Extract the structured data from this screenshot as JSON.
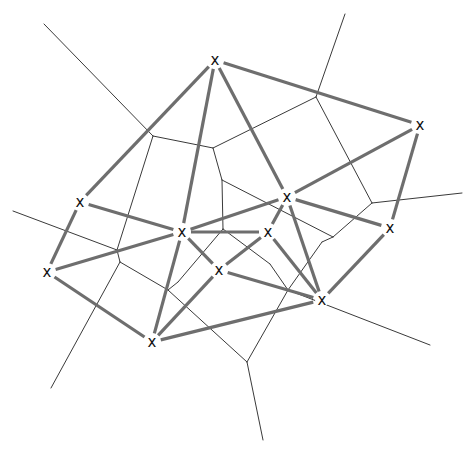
{
  "diagram": {
    "site_marker": "x",
    "colors": {
      "background": "#ffffff",
      "voronoi_edge": "#3a3a3a",
      "delaunay_edge": "#6e6e6e",
      "site_marker": "#111111"
    },
    "sites": [
      {
        "id": "A",
        "x": 215,
        "y": 60
      },
      {
        "id": "B",
        "x": 420,
        "y": 125
      },
      {
        "id": "C",
        "x": 80,
        "y": 202
      },
      {
        "id": "D",
        "x": 287,
        "y": 197
      },
      {
        "id": "E",
        "x": 182,
        "y": 232
      },
      {
        "id": "F",
        "x": 268,
        "y": 232
      },
      {
        "id": "G",
        "x": 390,
        "y": 228
      },
      {
        "id": "H",
        "x": 47,
        "y": 272
      },
      {
        "id": "I",
        "x": 219,
        "y": 270
      },
      {
        "id": "J",
        "x": 322,
        "y": 300
      },
      {
        "id": "K",
        "x": 152,
        "y": 342
      }
    ],
    "delaunay_edges": [
      [
        "A",
        "B"
      ],
      [
        "A",
        "C"
      ],
      [
        "A",
        "E"
      ],
      [
        "A",
        "D"
      ],
      [
        "B",
        "D"
      ],
      [
        "B",
        "G"
      ],
      [
        "C",
        "E"
      ],
      [
        "C",
        "H"
      ],
      [
        "D",
        "E"
      ],
      [
        "D",
        "F"
      ],
      [
        "D",
        "G"
      ],
      [
        "D",
        "J"
      ],
      [
        "E",
        "F"
      ],
      [
        "E",
        "H"
      ],
      [
        "E",
        "I"
      ],
      [
        "E",
        "K"
      ],
      [
        "F",
        "I"
      ],
      [
        "F",
        "J"
      ],
      [
        "G",
        "J"
      ],
      [
        "H",
        "K"
      ],
      [
        "I",
        "J"
      ],
      [
        "I",
        "K"
      ],
      [
        "J",
        "K"
      ]
    ],
    "voronoi_vertices": [
      {
        "id": "V1",
        "x": 153,
        "y": 136
      },
      {
        "id": "V2",
        "x": 213,
        "y": 148
      },
      {
        "id": "V3",
        "x": 316,
        "y": 97
      },
      {
        "id": "V4",
        "x": 222,
        "y": 180
      },
      {
        "id": "V5",
        "x": 223,
        "y": 229
      },
      {
        "id": "V6",
        "x": 120,
        "y": 262
      },
      {
        "id": "V7",
        "x": 168,
        "y": 290
      },
      {
        "id": "V8",
        "x": 333,
        "y": 237
      },
      {
        "id": "V9",
        "x": 372,
        "y": 203
      },
      {
        "id": "V10",
        "x": 288,
        "y": 290
      },
      {
        "id": "V11",
        "x": 247,
        "y": 362
      },
      {
        "id": "V12",
        "x": 262,
        "y": 283
      },
      {
        "id": "V13",
        "x": 117,
        "y": 250
      }
    ],
    "voronoi_segments": [
      [
        153,
        136,
        44,
        24
      ],
      [
        153,
        136,
        213,
        148
      ],
      [
        153,
        136,
        117,
        250
      ],
      [
        213,
        148,
        316,
        97
      ],
      [
        316,
        97,
        345,
        14
      ],
      [
        316,
        97,
        372,
        203
      ],
      [
        372,
        203,
        462,
        193
      ],
      [
        372,
        203,
        333,
        237
      ],
      [
        213,
        148,
        222,
        180
      ],
      [
        222,
        180,
        223,
        229
      ],
      [
        222,
        180,
        333,
        237
      ],
      [
        333,
        237,
        322,
        242
      ],
      [
        322,
        242,
        288,
        290
      ],
      [
        288,
        290,
        430,
        345
      ],
      [
        288,
        290,
        247,
        362
      ],
      [
        247,
        362,
        263,
        440
      ],
      [
        223,
        229,
        178,
        282
      ],
      [
        223,
        229,
        270,
        264
      ],
      [
        270,
        264,
        288,
        290
      ],
      [
        117,
        250,
        13,
        211
      ],
      [
        117,
        250,
        120,
        262
      ],
      [
        120,
        262,
        168,
        290
      ],
      [
        120,
        262,
        51,
        388
      ],
      [
        168,
        290,
        247,
        362
      ],
      [
        178,
        282,
        168,
        290
      ]
    ]
  }
}
